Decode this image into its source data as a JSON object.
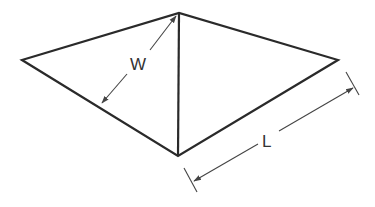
{
  "diagram": {
    "type": "geometric-dimension-drawing",
    "shape": "rhombus (kite) divided by vertical diagonal",
    "labels": {
      "width": "W",
      "length": "L"
    },
    "colors": {
      "stroke": "#2a2a2a",
      "dimension": "#444444",
      "background": "#ffffff"
    },
    "vertices": {
      "top": [
        179,
        13
      ],
      "left": [
        22,
        60
      ],
      "right": [
        338,
        60
      ],
      "bottom": [
        178,
        156
      ]
    }
  }
}
